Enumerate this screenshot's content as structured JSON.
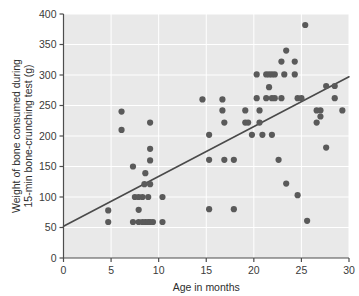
{
  "chart_data": {
    "type": "scatter",
    "title": "",
    "xlabel": "Age in months",
    "ylabel": "Weight of bone consumed during 15-min bone-crunching test (g)",
    "ylabel_line1": "Weight of bone consumed during",
    "ylabel_line2": "15-min bone-crunching test (g)",
    "xlim": [
      0,
      30
    ],
    "ylim": [
      0,
      400
    ],
    "xticks": [
      0,
      5,
      10,
      15,
      20,
      25,
      30
    ],
    "yticks": [
      0,
      50,
      100,
      150,
      200,
      250,
      300,
      350,
      400
    ],
    "xtick_labels": [
      "0",
      "5",
      "10",
      "15",
      "20",
      "25",
      "30"
    ],
    "ytick_labels": [
      "0",
      "50",
      "100",
      "150",
      "200",
      "250",
      "300",
      "350",
      "400"
    ],
    "grid": true,
    "grid_color": "#ffffff",
    "plot_background": "#e9e9e9",
    "point_color": "#5a5a5a",
    "point_radius": 3.1,
    "legend": "none",
    "trendline": {
      "type": "linear",
      "x_start": 0,
      "y_start": 52,
      "x_end": 30,
      "y_end": 297,
      "color": "#4a4a4a",
      "width": 1.6
    },
    "points": [
      [
        4.7,
        78
      ],
      [
        4.7,
        59
      ],
      [
        6.1,
        240
      ],
      [
        6.1,
        210
      ],
      [
        7.3,
        150
      ],
      [
        7.3,
        59
      ],
      [
        7.5,
        100
      ],
      [
        7.9,
        100
      ],
      [
        7.9,
        79
      ],
      [
        7.9,
        59
      ],
      [
        8.3,
        100
      ],
      [
        8.3,
        59
      ],
      [
        8.5,
        121
      ],
      [
        8.6,
        139
      ],
      [
        8.6,
        59
      ],
      [
        8.9,
        100
      ],
      [
        8.9,
        59
      ],
      [
        9.1,
        222
      ],
      [
        9.1,
        179
      ],
      [
        9.1,
        160
      ],
      [
        9.1,
        121
      ],
      [
        9.1,
        59
      ],
      [
        9.4,
        59
      ],
      [
        10.4,
        100
      ],
      [
        10.4,
        59
      ],
      [
        14.6,
        260
      ],
      [
        15.3,
        202
      ],
      [
        15.3,
        161
      ],
      [
        15.3,
        80
      ],
      [
        16.7,
        260
      ],
      [
        16.7,
        242
      ],
      [
        16.9,
        222
      ],
      [
        16.9,
        161
      ],
      [
        17.9,
        161
      ],
      [
        17.9,
        80
      ],
      [
        19.1,
        242
      ],
      [
        19.1,
        222
      ],
      [
        19.4,
        222
      ],
      [
        19.8,
        202
      ],
      [
        20.3,
        301
      ],
      [
        20.3,
        262
      ],
      [
        20.6,
        242
      ],
      [
        20.6,
        222
      ],
      [
        20.9,
        202
      ],
      [
        21.3,
        301
      ],
      [
        21.3,
        262
      ],
      [
        21.6,
        301
      ],
      [
        21.6,
        280
      ],
      [
        21.9,
        301
      ],
      [
        21.9,
        262
      ],
      [
        21.9,
        202
      ],
      [
        22.2,
        301
      ],
      [
        22.2,
        262
      ],
      [
        22.6,
        161
      ],
      [
        22.9,
        322
      ],
      [
        22.9,
        262
      ],
      [
        23.2,
        301
      ],
      [
        23.4,
        340
      ],
      [
        23.4,
        122
      ],
      [
        24.3,
        322
      ],
      [
        24.3,
        301
      ],
      [
        24.6,
        262
      ],
      [
        24.6,
        103
      ],
      [
        25.0,
        262
      ],
      [
        25.4,
        382
      ],
      [
        25.6,
        61
      ],
      [
        26.6,
        242
      ],
      [
        26.6,
        222
      ],
      [
        27.0,
        242
      ],
      [
        27.0,
        232
      ],
      [
        27.6,
        282
      ],
      [
        27.6,
        181
      ],
      [
        28.5,
        282
      ],
      [
        28.5,
        262
      ],
      [
        29.3,
        242
      ]
    ]
  }
}
